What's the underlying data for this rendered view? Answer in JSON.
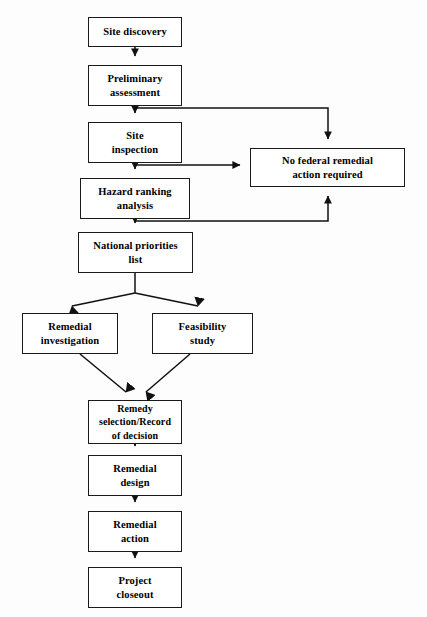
{
  "diagram": {
    "background_color": "#fdfdfd",
    "line_color": "#1a1a1a",
    "nodes": [
      {
        "id": "site-discovery",
        "label": "Site discovery",
        "x": 88,
        "y": 17,
        "w": 94,
        "h": 30
      },
      {
        "id": "preliminary-assessment",
        "label": "Preliminary\nassessment",
        "x": 88,
        "y": 65,
        "w": 94,
        "h": 41
      },
      {
        "id": "site-inspection",
        "label": "Site\ninspection",
        "x": 88,
        "y": 122,
        "w": 94,
        "h": 41
      },
      {
        "id": "hazard-ranking",
        "label": "Hazard ranking\nanalysis",
        "x": 80,
        "y": 178,
        "w": 110,
        "h": 41
      },
      {
        "id": "national-priorities",
        "label": "National priorities\nlist",
        "x": 78,
        "y": 232,
        "w": 115,
        "h": 41
      },
      {
        "id": "no-federal-action",
        "label": "No federal remedial\naction required",
        "x": 250,
        "y": 148,
        "w": 155,
        "h": 39
      },
      {
        "id": "remedial-investigation",
        "label": "Remedial\ninvestigation",
        "x": 22,
        "y": 313,
        "w": 96,
        "h": 41
      },
      {
        "id": "feasibility-study",
        "label": "Feasibility\nstudy",
        "x": 152,
        "y": 313,
        "w": 101,
        "h": 41
      },
      {
        "id": "remedy-selection",
        "label": "Remedy\nselection/Record\nof decision",
        "x": 88,
        "y": 400,
        "w": 94,
        "h": 44
      },
      {
        "id": "remedial-design",
        "label": "Remedial\ndesign",
        "x": 88,
        "y": 455,
        "w": 94,
        "h": 41
      },
      {
        "id": "remedial-action",
        "label": "Remedial\naction",
        "x": 88,
        "y": 511,
        "w": 94,
        "h": 41
      },
      {
        "id": "project-closeout",
        "label": "Project\ncloseout",
        "x": 88,
        "y": 567,
        "w": 94,
        "h": 41
      }
    ],
    "edges": [
      {
        "id": "e-discovery-to-preliminary",
        "from": "site-discovery",
        "to": "preliminary-assessment",
        "kind": "straight-down"
      },
      {
        "id": "e-preliminary-to-inspection",
        "from": "preliminary-assessment",
        "to": "site-inspection",
        "kind": "straight-down"
      },
      {
        "id": "e-inspection-to-hazard",
        "from": "site-inspection",
        "to": "hazard-ranking",
        "kind": "straight-down"
      },
      {
        "id": "e-hazard-to-npl",
        "from": "hazard-ranking",
        "to": "national-priorities",
        "kind": "straight-down"
      },
      {
        "id": "e-preliminary-to-no-federal",
        "from": "preliminary-assessment",
        "to": "no-federal-action",
        "kind": "elbow-right-down"
      },
      {
        "id": "e-inspection-to-no-federal",
        "from": "site-inspection",
        "to": "no-federal-action",
        "kind": "elbow-right"
      },
      {
        "id": "e-hazard-to-no-federal",
        "from": "hazard-ranking",
        "to": "no-federal-action",
        "kind": "elbow-right-up"
      },
      {
        "id": "e-npl-to-remedial-invest",
        "from": "national-priorities",
        "to": "remedial-investigation",
        "kind": "diagonal-split-left"
      },
      {
        "id": "e-npl-to-feasibility",
        "from": "national-priorities",
        "to": "feasibility-study",
        "kind": "diagonal-split-right"
      },
      {
        "id": "e-remedial-invest-to-remedy",
        "from": "remedial-investigation",
        "to": "remedy-selection",
        "kind": "diagonal-merge-left"
      },
      {
        "id": "e-feasibility-to-remedy",
        "from": "feasibility-study",
        "to": "remedy-selection",
        "kind": "diagonal-merge-right"
      },
      {
        "id": "e-remedy-to-design",
        "from": "remedy-selection",
        "to": "remedial-design",
        "kind": "straight-down"
      },
      {
        "id": "e-design-to-action",
        "from": "remedial-design",
        "to": "remedial-action",
        "kind": "straight-down"
      },
      {
        "id": "e-action-to-closeout",
        "from": "remedial-action",
        "to": "project-closeout",
        "kind": "straight-down"
      }
    ]
  }
}
